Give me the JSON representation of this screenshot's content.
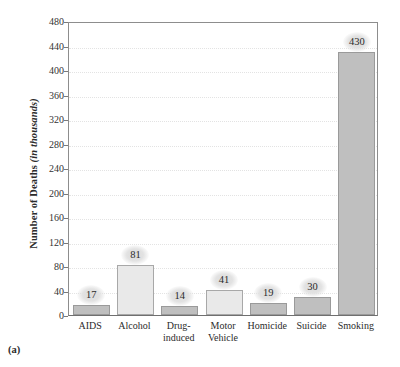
{
  "figure": {
    "panel_label": "(a)",
    "background_color": "#ffffff"
  },
  "chart_data": {
    "type": "bar",
    "title": "",
    "xlabel": "",
    "ylabel": "Number of Deaths (in thousands)",
    "ylabel_main": "Number of Deaths ",
    "ylabel_units": "(in thousands)",
    "ylim": [
      0,
      480
    ],
    "ytick_step": 40,
    "yticks": [
      0,
      40,
      80,
      120,
      160,
      200,
      240,
      280,
      320,
      360,
      400,
      440,
      480
    ],
    "grid": true,
    "grid_style": "dotted-horizontal",
    "legend": "none",
    "categories": [
      "AIDS",
      "Alcohol",
      "Drug-induced",
      "Motor Vehicle",
      "Homicide",
      "Suicide",
      "Smoking"
    ],
    "category_lines": [
      [
        "AIDS"
      ],
      [
        "Alcohol"
      ],
      [
        "Drug-",
        "induced"
      ],
      [
        "Motor",
        "Vehicle"
      ],
      [
        "Homicide"
      ],
      [
        "Suicide"
      ],
      [
        "Smoking"
      ]
    ],
    "values": [
      17,
      81,
      14,
      41,
      19,
      30,
      430
    ],
    "value_labels": [
      "17",
      "81",
      "14",
      "41",
      "19",
      "30",
      "430"
    ],
    "bar_colors": [
      "#bfbfbf",
      "#e9e9e9",
      "#bfbfbf",
      "#e9e9e9",
      "#bfbfbf",
      "#bfbfbf",
      "#bfbfbf"
    ],
    "bar_shades": [
      "dark",
      "light",
      "dark",
      "light",
      "dark",
      "dark",
      "dark"
    ],
    "colors": {
      "bar_light": "#e9e9e9",
      "bar_dark": "#bfbfbf",
      "bar_edge": "#9a9a9a",
      "axis": "#6f6f6f",
      "grid": "#e3e3e3",
      "text": "#2b2b2b",
      "label_bubble": "#dcdcdc"
    }
  }
}
